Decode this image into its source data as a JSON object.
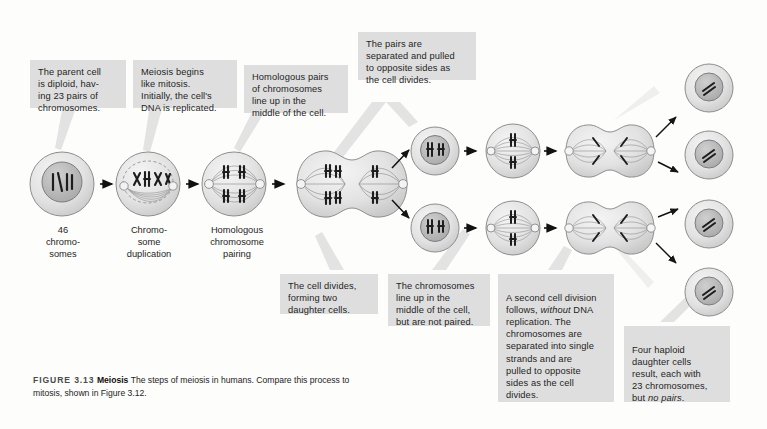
{
  "figure": {
    "number": "FIGURE 3.13",
    "title": "Meiosis",
    "caption_line1": "The steps of meiosis in humans. Compare this process to mitosis,",
    "caption_line2": "shown in Figure 3.12.",
    "background_color": "#fdfdfb",
    "callout_color": "#dedede",
    "ink_color": "#1e1e1e"
  },
  "callouts": [
    {
      "id": "parent-cell",
      "text": "The parent cell\nis diploid, hav-\ning 23 pairs of\nchromosomes."
    },
    {
      "id": "meiosis-begins",
      "text": "Meiosis begins\nlike mitosis.\nInitially, the cell's\nDNA is replicated."
    },
    {
      "id": "homologous-pairs",
      "text": "Homologous pairs\nof chromosomes\nline up in the\nmiddle of the cell."
    },
    {
      "id": "pairs-separated",
      "text": "The pairs are\nseparated and pulled\nto opposite sides as\nthe cell divides."
    },
    {
      "id": "cell-divides",
      "text": "The cell divides,\nforming two\ndaughter cells."
    },
    {
      "id": "chromosomes-line-up",
      "text": "The chromosomes\nline up in the\nmiddle of the cell,\nbut are not paired."
    },
    {
      "id": "second-division",
      "text_before_italic": "A second cell division\nfollows, ",
      "italic": "without",
      "text_after_italic": " DNA\nreplication. The\nchromosomes are\nseparated into single\nstrands and are\npulled to opposite\nsides as the cell\ndivides."
    },
    {
      "id": "four-haploid",
      "text_before_italic": "Four haploid\ndaughter cells\nresult, each with\n23 chromosomes,\nbut ",
      "italic": "no pairs",
      "text_after_italic": "."
    }
  ],
  "cell_labels": [
    {
      "id": "label-46-chromosomes",
      "text": "46\nchromo-\nsomes"
    },
    {
      "id": "label-chromosome-duplication",
      "text": "Chromo-\nsome\nduplication"
    },
    {
      "id": "label-homologous-pairing",
      "text": "Homologous\nchromosome\npairing"
    }
  ],
  "stages": [
    {
      "id": "stage-parent-cell",
      "name": "parent cell, diploid nucleus"
    },
    {
      "id": "stage-dna-replicated",
      "name": "chromosome duplication, spindle forming"
    },
    {
      "id": "stage-homologous-pairing",
      "name": "homologous chromosome pairing at metaphase plate"
    },
    {
      "id": "stage-meiosis-i-anaphase",
      "name": "pairs separated, cell dividing"
    },
    {
      "id": "stage-daughter-cell-upper",
      "name": "upper daughter cell after meiosis I"
    },
    {
      "id": "stage-daughter-cell-lower",
      "name": "lower daughter cell after meiosis I"
    },
    {
      "id": "stage-metaphase-ii-upper",
      "name": "upper cell, chromosomes lined up unpaired"
    },
    {
      "id": "stage-metaphase-ii-lower",
      "name": "lower cell, chromosomes lined up unpaired"
    },
    {
      "id": "stage-anaphase-ii-upper",
      "name": "upper cell, second division"
    },
    {
      "id": "stage-anaphase-ii-lower",
      "name": "lower cell, second division"
    },
    {
      "id": "stage-haploid-1",
      "name": "haploid daughter cell 1"
    },
    {
      "id": "stage-haploid-2",
      "name": "haploid daughter cell 2"
    },
    {
      "id": "stage-haploid-3",
      "name": "haploid daughter cell 3"
    },
    {
      "id": "stage-haploid-4",
      "name": "haploid daughter cell 4"
    }
  ]
}
